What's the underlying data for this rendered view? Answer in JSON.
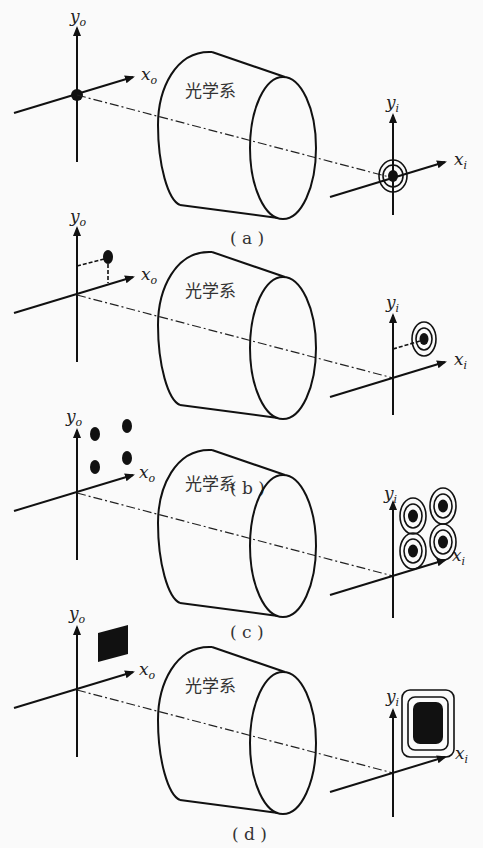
{
  "figure": {
    "system_label": "光学系",
    "axis_labels": {
      "object_y": "y",
      "object_y_sub": "o",
      "object_x": "x",
      "object_x_sub": "o",
      "image_y": "y",
      "image_y_sub": "i",
      "image_x": "x",
      "image_x_sub": "i"
    },
    "panels": [
      {
        "id": "a",
        "caption": "( a )",
        "object": "point on axis",
        "image": "point with concentric rings on axis"
      },
      {
        "id": "b",
        "caption": "( b )",
        "object": "off-axis point",
        "image": "off-axis point with concentric rings"
      },
      {
        "id": "c",
        "caption": "( c )",
        "object": "four points",
        "image": "four points with concentric rings"
      },
      {
        "id": "d",
        "caption": "( d )",
        "object": "filled square",
        "image": "filled rounded rectangle with surrounding contours"
      }
    ]
  }
}
